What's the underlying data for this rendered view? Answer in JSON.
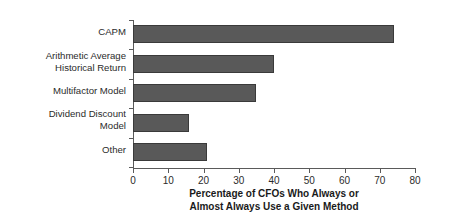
{
  "chart_data": {
    "type": "bar",
    "orientation": "horizontal",
    "title": "",
    "xlabel": "Percentage of CFOs Who Always or\nAlmost Always Use a Given Method",
    "ylabel": "Cost of Equity Capital Method",
    "categories": [
      "CAPM",
      "Arithmetic Average\nHistorical Return",
      "Multifactor Model",
      "Dividend Discount\nModel",
      "Other"
    ],
    "values": [
      74,
      40,
      35,
      16,
      21
    ],
    "xlim": [
      0,
      80
    ],
    "xticks": [
      0,
      10,
      20,
      30,
      40,
      50,
      60,
      70,
      80
    ],
    "xticklabels": [
      "0",
      "10",
      "20",
      "30",
      "40",
      "50",
      "60",
      "70",
      "80"
    ],
    "grid": false,
    "legend": false,
    "bar_color": "#595959",
    "bar_edge_color": "#3a3a3a",
    "axis_color": "#5a5a5a",
    "background": "#ffffff"
  }
}
